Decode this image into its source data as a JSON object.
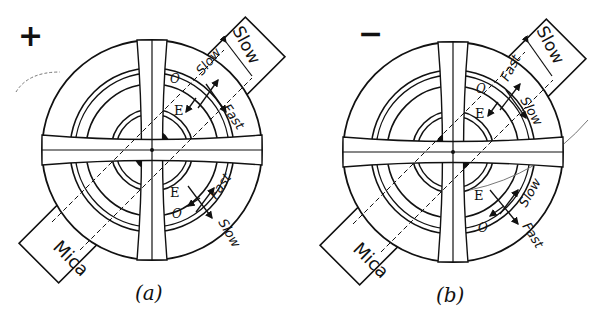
{
  "figure": {
    "panels": [
      {
        "id": "a",
        "sign": "+",
        "caption": "(a)",
        "plate": {
          "label": "Mica",
          "top_label": "Slow"
        },
        "upper_labels": {
          "outer": "Slow",
          "inner": "Fast",
          "ray_o": "O",
          "ray_e": "E"
        },
        "lower_labels": {
          "outer": "Slow",
          "inner": "Fast",
          "ray_o": "O",
          "ray_e": "E"
        }
      },
      {
        "id": "b",
        "sign": "−",
        "caption": "(b)",
        "plate": {
          "label": "Mica",
          "top_label": "Slow"
        },
        "upper_labels": {
          "outer": "Fast",
          "inner": "Slow",
          "ray_o": "O",
          "ray_e": "E"
        },
        "lower_labels": {
          "outer": "Fast",
          "inner": "Slow",
          "ray_o": "O",
          "ray_e": "E"
        }
      }
    ],
    "colors": {
      "ink": "#111111",
      "paper": "#ffffff"
    }
  }
}
